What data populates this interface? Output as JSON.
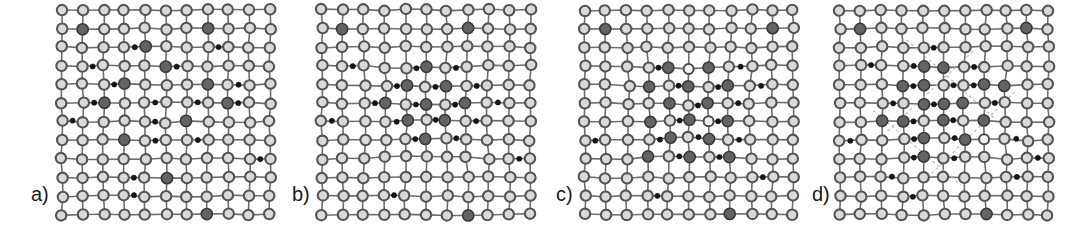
{
  "figure": {
    "kind": "lattice-diagram",
    "panel_count": 4,
    "width": 1091,
    "height": 230,
    "background": "#ffffff"
  },
  "legend_semantics": {
    "host_atom": "light gray ring circle - host matrix atom",
    "dopant_atom": "large dark gray filled circle - substitutional solute atom",
    "interstitial_atom": "small black filled dot - interstitial atom",
    "open_atom": "near-white circle with dark ring - vacancy / displaced site"
  },
  "colors": {
    "host_fill": "#d9d9d9",
    "host_stroke": "#555555",
    "dopant_fill": "#636363",
    "dopant_stroke": "#3a3a3a",
    "interstitial_fill": "#151515",
    "open_fill": "#f2f2f2",
    "bond_stroke": "#6e6e6e",
    "guide_stroke": "#bdbdbd",
    "label_color": "#1a1a1a",
    "background": "#ffffff"
  },
  "geometry": {
    "cols": 11,
    "rows": 12,
    "spacing_x": 20.8,
    "spacing_y": 18.6,
    "origin_x": 10,
    "origin_y": 10,
    "r_host": 5.2,
    "r_dopant": 5.6,
    "r_inter": 2.6,
    "r_open": 5.0
  },
  "panels": [
    {
      "id": "a",
      "label": "a)",
      "label_x": 31,
      "label_y": 183,
      "panel_x": 52,
      "caption_state": "random dilute solid solution",
      "dopants": [
        [
          1,
          1
        ],
        [
          7,
          1
        ],
        [
          4,
          2
        ],
        [
          5,
          3
        ],
        [
          3,
          4
        ],
        [
          7,
          4
        ],
        [
          2,
          5
        ],
        [
          8,
          5
        ],
        [
          6,
          6
        ],
        [
          3,
          7
        ],
        [
          5,
          9
        ],
        [
          7,
          11
        ]
      ],
      "interstitials": [
        [
          3,
          2
        ],
        [
          7,
          2
        ],
        [
          1,
          3
        ],
        [
          5,
          3
        ],
        [
          2,
          4
        ],
        [
          8,
          4
        ],
        [
          1,
          5
        ],
        [
          4,
          5
        ],
        [
          6,
          5
        ],
        [
          8,
          5
        ],
        [
          0,
          6
        ],
        [
          4,
          6
        ],
        [
          4,
          7
        ],
        [
          6,
          7
        ],
        [
          9,
          8
        ],
        [
          3,
          9
        ],
        [
          3,
          10
        ]
      ],
      "opens": [],
      "jitter_seed": 11
    },
    {
      "id": "b",
      "label": "b)",
      "label_x": 292,
      "label_y": 183,
      "panel_x": 312,
      "caption_state": "spherical coherent solute cluster (GP zone)",
      "dopants": [
        [
          1,
          1
        ],
        [
          7,
          1
        ],
        [
          5,
          3
        ],
        [
          4,
          4
        ],
        [
          6,
          4
        ],
        [
          3,
          5
        ],
        [
          5,
          5
        ],
        [
          7,
          5
        ],
        [
          4,
          6
        ],
        [
          6,
          6
        ],
        [
          5,
          7
        ],
        [
          7,
          11
        ]
      ],
      "interstitials": [
        [
          1,
          3
        ],
        [
          4,
          3
        ],
        [
          6,
          3
        ],
        [
          3,
          4
        ],
        [
          5,
          4
        ],
        [
          7,
          4
        ],
        [
          2,
          5
        ],
        [
          4,
          5
        ],
        [
          6,
          5
        ],
        [
          8,
          5
        ],
        [
          0,
          6
        ],
        [
          3,
          6
        ],
        [
          5,
          6
        ],
        [
          7,
          6
        ],
        [
          4,
          7
        ],
        [
          6,
          7
        ],
        [
          9,
          8
        ],
        [
          3,
          10
        ]
      ],
      "opens": [],
      "jitter_seed": 23
    },
    {
      "id": "c",
      "label": "c)",
      "label_x": 556,
      "label_y": 183,
      "panel_x": 575,
      "caption_state": "plate-like ordered precipitate, columnar habit",
      "dopants": [
        [
          1,
          1
        ],
        [
          9,
          1
        ],
        [
          4,
          3
        ],
        [
          6,
          3
        ],
        [
          3,
          4
        ],
        [
          5,
          4
        ],
        [
          7,
          4
        ],
        [
          4,
          5
        ],
        [
          6,
          5
        ],
        [
          3,
          6
        ],
        [
          5,
          6
        ],
        [
          7,
          6
        ],
        [
          4,
          7
        ],
        [
          6,
          7
        ],
        [
          3,
          8
        ],
        [
          5,
          8
        ],
        [
          7,
          8
        ],
        [
          7,
          11
        ]
      ],
      "interstitials": [
        [
          3,
          3
        ],
        [
          7,
          3
        ],
        [
          4,
          4
        ],
        [
          6,
          4
        ],
        [
          8,
          4
        ],
        [
          5,
          5
        ],
        [
          7,
          5
        ],
        [
          4,
          6
        ],
        [
          6,
          6
        ],
        [
          3,
          7
        ],
        [
          5,
          7
        ],
        [
          7,
          7
        ],
        [
          0,
          7
        ],
        [
          4,
          8
        ],
        [
          6,
          8
        ],
        [
          8,
          9
        ],
        [
          3,
          10
        ]
      ],
      "opens": [
        [
          5,
          3
        ],
        [
          4,
          5
        ],
        [
          6,
          6
        ],
        [
          5,
          8
        ]
      ],
      "jitter_seed": 37
    },
    {
      "id": "d",
      "label": "d)",
      "label_x": 812,
      "label_y": 183,
      "panel_x": 830,
      "caption_state": "rotated semi-coherent precipitate with misfit interface",
      "dopants": [
        [
          1,
          1
        ],
        [
          9,
          1
        ],
        [
          4,
          3
        ],
        [
          5,
          3
        ],
        [
          3,
          4
        ],
        [
          4,
          4
        ],
        [
          7,
          4
        ],
        [
          8,
          4
        ],
        [
          2,
          6
        ],
        [
          4,
          5
        ],
        [
          5,
          5
        ],
        [
          6,
          5
        ],
        [
          3,
          6
        ],
        [
          5,
          6
        ],
        [
          7,
          6
        ],
        [
          4,
          7
        ],
        [
          6,
          7
        ],
        [
          4,
          8
        ],
        [
          7,
          11
        ]
      ],
      "interstitials": [
        [
          4,
          2
        ],
        [
          1,
          3
        ],
        [
          3,
          3
        ],
        [
          6,
          3
        ],
        [
          3,
          4
        ],
        [
          5,
          4
        ],
        [
          6,
          4
        ],
        [
          2,
          5
        ],
        [
          4,
          5
        ],
        [
          7,
          5
        ],
        [
          3,
          6
        ],
        [
          5,
          6
        ],
        [
          0,
          7
        ],
        [
          3,
          7
        ],
        [
          5,
          7
        ],
        [
          8,
          7
        ],
        [
          3,
          8
        ],
        [
          5,
          8
        ],
        [
          9,
          8
        ],
        [
          2,
          9
        ],
        [
          8,
          9
        ],
        [
          3,
          10
        ]
      ],
      "opens": [
        [
          2,
          6
        ],
        [
          4,
          7
        ],
        [
          7,
          7
        ]
      ],
      "guides": [
        [
          3.2,
          1.6,
          7.4,
          5.8
        ],
        [
          1.6,
          5.4,
          5.8,
          9.4
        ],
        [
          6.4,
          2.2,
          2.2,
          6.6
        ],
        [
          8.4,
          4.4,
          4.4,
          8.8
        ]
      ],
      "jitter_seed": 53
    }
  ]
}
